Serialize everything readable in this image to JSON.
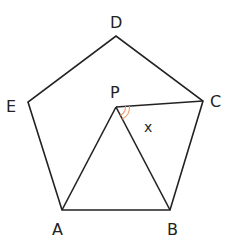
{
  "diagram": {
    "colors": {
      "line": "#222222",
      "arc": "#f0a070",
      "background": "#ffffff"
    },
    "vertices": {
      "A": {
        "label": "A",
        "x": 62,
        "y": 210
      },
      "B": {
        "label": "B",
        "x": 170,
        "y": 210
      },
      "C": {
        "label": "C",
        "x": 203,
        "y": 101
      },
      "D": {
        "label": "D",
        "x": 116,
        "y": 36
      },
      "E": {
        "label": "E",
        "x": 28,
        "y": 102
      },
      "P": {
        "label": "P",
        "x": 116,
        "y": 107
      }
    },
    "segments": [
      "AB",
      "BC",
      "CD",
      "DE",
      "EA",
      "PA",
      "PB",
      "PC"
    ],
    "angle": {
      "label": "x",
      "vertex": "P",
      "between": [
        "PC",
        "PB"
      ],
      "marker": "double-arc"
    }
  }
}
